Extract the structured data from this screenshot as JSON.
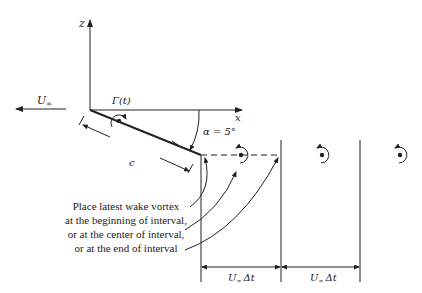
{
  "diagram": {
    "axes": {
      "z_label": "z",
      "x_label": "x"
    },
    "freestream": {
      "label_main": "U",
      "label_sub": "∞"
    },
    "circulation": {
      "label": "Γ(t)"
    },
    "angle": {
      "label": "α = 5°"
    },
    "chord": {
      "label": "c"
    },
    "annotation": {
      "lines": [
        "Place latest wake vortex",
        "at the beginning of interval,",
        "or at the center of interval,",
        "or at the end of interval"
      ]
    },
    "intervals": [
      {
        "label_main": "U",
        "label_sub": "∞",
        "label_rest": "Δt"
      },
      {
        "label_main": "U",
        "label_sub": "∞",
        "label_rest": "Δt"
      }
    ],
    "colors": {
      "stroke": "#222222",
      "background": "#ffffff"
    }
  }
}
